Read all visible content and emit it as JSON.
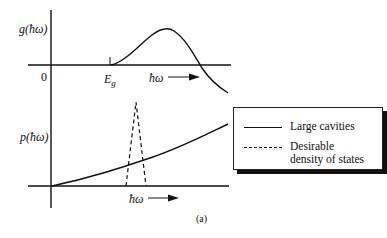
{
  "figure": {
    "caption": "(a)",
    "top_plot": {
      "y_label": "g(ħω)",
      "origin_label": "0",
      "gap_label": "E",
      "gap_subscript": "g",
      "x_label": "ħω"
    },
    "bottom_plot": {
      "y_label": "p(ħω)",
      "x_label": "ħω"
    },
    "legend": {
      "items": [
        {
          "style": "solid",
          "label": "Large cavities"
        },
        {
          "style": "dashed",
          "label_line1": "Desirable",
          "label_line2": "density of states"
        }
      ]
    },
    "colors": {
      "ink": "#111111",
      "background": "#ffffff"
    }
  }
}
